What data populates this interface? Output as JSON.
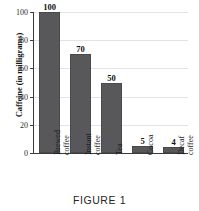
{
  "caption": "FIGURE 1",
  "chart_data": {
    "type": "bar",
    "title": "",
    "xlabel": "",
    "ylabel": "Caffeine (in milligrams)",
    "categories": [
      "Brewed coffee",
      "Instant coffee",
      "Tea",
      "Cocoa",
      "Decaf coffee"
    ],
    "category_lines": [
      [
        "Brewed",
        "coffee"
      ],
      [
        "Instant",
        "coffee"
      ],
      [
        "Tea",
        ""
      ],
      [
        "Cocoa",
        ""
      ],
      [
        "Decaf",
        "coffee"
      ]
    ],
    "values": [
      100,
      70,
      50,
      5,
      4
    ],
    "value_labels": [
      "100",
      "70",
      "50",
      "5",
      "4"
    ],
    "ylim": [
      0,
      100
    ],
    "yticks": [
      0,
      20,
      40,
      60,
      80,
      100
    ],
    "ytick_labels": [
      "0",
      "20",
      "40",
      "60",
      "80",
      "100"
    ],
    "grid": true,
    "legend": false,
    "bar_color": "#58585a",
    "grid_color": "#e3e3e3",
    "axis_color": "#3a3a3a"
  }
}
